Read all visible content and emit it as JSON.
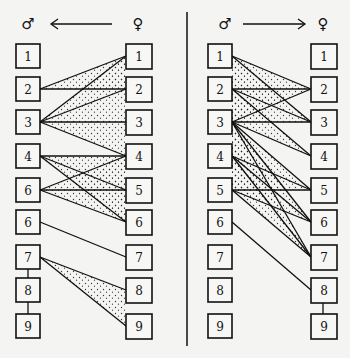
{
  "left_panel": {
    "header": {
      "male_symbol": "♂",
      "female_symbol": "♀",
      "arrow_direction": "female-to-male"
    },
    "male_labels": [
      "1",
      "2",
      "3",
      "4",
      "6",
      "6",
      "7",
      "8",
      "9"
    ],
    "female_labels": [
      "1",
      "2",
      "3",
      "4",
      "5",
      "6",
      "7",
      "8",
      "9"
    ],
    "connections": [
      [
        1,
        2
      ],
      [
        1,
        3
      ],
      [
        2,
        2
      ],
      [
        2,
        3
      ],
      [
        3,
        3
      ],
      [
        4,
        3
      ],
      [
        4,
        4
      ],
      [
        4,
        5
      ],
      [
        5,
        4
      ],
      [
        5,
        5
      ],
      [
        6,
        4
      ],
      [
        6,
        5
      ],
      [
        7,
        6
      ],
      [
        8,
        7
      ],
      [
        9,
        7
      ]
    ],
    "vertical_links_male": [
      [
        7,
        8
      ],
      [
        8,
        9
      ]
    ]
  },
  "right_panel": {
    "header": {
      "male_symbol": "♂",
      "female_symbol": "♀",
      "arrow_direction": "male-to-female"
    },
    "male_labels": [
      "1",
      "2",
      "3",
      "4",
      "5",
      "6",
      "7",
      "8",
      "9"
    ],
    "female_labels": [
      "1",
      "2",
      "3",
      "4",
      "5",
      "6",
      "7",
      "8",
      "9"
    ],
    "connections": [
      [
        1,
        2
      ],
      [
        1,
        3
      ],
      [
        2,
        2
      ],
      [
        2,
        3
      ],
      [
        2,
        4
      ],
      [
        3,
        2
      ],
      [
        3,
        3
      ],
      [
        3,
        4
      ],
      [
        3,
        5
      ],
      [
        3,
        6
      ],
      [
        3,
        7
      ],
      [
        4,
        5
      ],
      [
        4,
        6
      ],
      [
        4,
        7
      ],
      [
        5,
        5
      ],
      [
        5,
        6
      ],
      [
        5,
        7
      ],
      [
        6,
        8
      ]
    ],
    "vertical_links_female": [
      [
        8,
        9
      ]
    ]
  },
  "colors": {
    "ink": "#111111",
    "paper": "#f4f4f2"
  }
}
